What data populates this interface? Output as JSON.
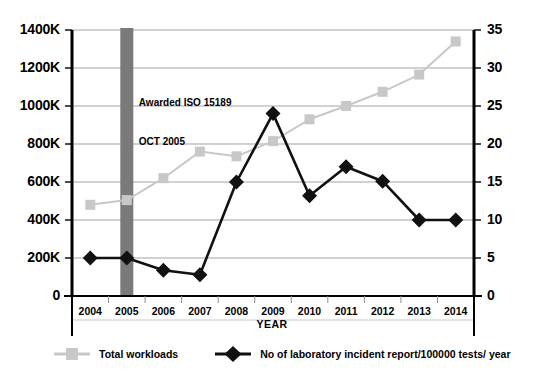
{
  "chart_data": {
    "type": "line",
    "title": "",
    "xlabel": "YEAR",
    "categories": [
      "2004",
      "2005",
      "2006",
      "2007",
      "2008",
      "2009",
      "2010",
      "2011",
      "2012",
      "2013",
      "2014"
    ],
    "series": [
      {
        "name": "Total workloads",
        "axis": "left",
        "color": "#c8c8c8",
        "marker": "square",
        "values": [
          480000,
          505000,
          620000,
          760000,
          735000,
          815000,
          930000,
          1000000,
          1075000,
          1165000,
          1340000
        ]
      },
      {
        "name": "No of laboratory incident report/100000 tests/ year",
        "axis": "right",
        "color": "#111111",
        "marker": "diamond",
        "values": [
          5.0,
          5.0,
          3.4,
          2.8,
          15.0,
          24.0,
          13.2,
          17.0,
          15.1,
          10.0,
          10.0
        ]
      }
    ],
    "left_axis": {
      "ticks": [
        "0",
        "200K",
        "400K",
        "600K",
        "800K",
        "1000K",
        "1200K",
        "1400K"
      ],
      "values": [
        0,
        200000,
        400000,
        600000,
        800000,
        1000000,
        1200000,
        1400000
      ],
      "ylim": [
        0,
        1400000
      ]
    },
    "right_axis": {
      "ticks": [
        "0",
        "5",
        "10",
        "15",
        "20",
        "25",
        "30",
        "35"
      ],
      "values": [
        0,
        5,
        10,
        15,
        20,
        25,
        30,
        35
      ],
      "ylim": [
        0,
        35
      ]
    },
    "grid": true,
    "legend_position": "bottom",
    "annotations": [
      {
        "name": "iso-award-marker",
        "line1": "Awarded ISO 15189",
        "line2": "OCT 2005",
        "at_category": "2005",
        "band_color": "#7a7a7a"
      }
    ]
  },
  "legend": {
    "items": [
      {
        "label": "Total workloads",
        "marker": "square-marker",
        "color": "#c8c8c8"
      },
      {
        "label": "No of laboratory incident report/100000 tests/ year",
        "marker": "diamond-marker",
        "color": "#111111"
      }
    ]
  }
}
